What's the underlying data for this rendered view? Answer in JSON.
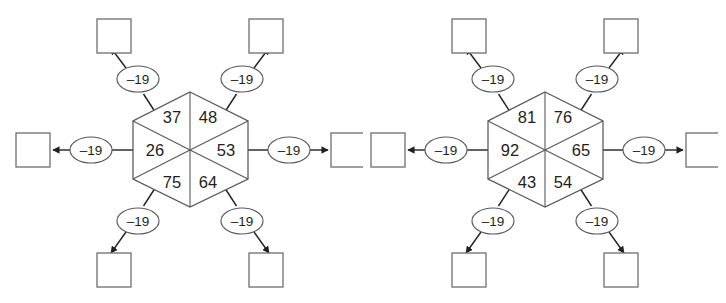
{
  "worksheet": {
    "title": "Hexagon subtraction puzzles",
    "background_color": "#ffffff",
    "line_color": "#58595b",
    "text_color": "#231f20",
    "box_stroke_color": "#6d6e71"
  },
  "figures": [
    {
      "id": "figure-left",
      "name": "hexagon-puzzle-1",
      "center": {
        "x": 190,
        "y": 150
      },
      "hexagon": {
        "radius": 58,
        "sectors": [
          {
            "position": "top-left",
            "value": "37"
          },
          {
            "position": "top-right",
            "value": "48"
          },
          {
            "position": "right",
            "value": "53"
          },
          {
            "position": "bottom-right",
            "value": "64"
          },
          {
            "position": "bottom-left",
            "value": "75"
          },
          {
            "position": "left",
            "value": "26"
          }
        ]
      },
      "operations": [
        {
          "position": "top-left",
          "label": "–19"
        },
        {
          "position": "top-right",
          "label": "–19"
        },
        {
          "position": "right",
          "label": "–19"
        },
        {
          "position": "bottom-right",
          "label": "–19"
        },
        {
          "position": "bottom-left",
          "label": "–19"
        },
        {
          "position": "left",
          "label": "–19"
        }
      ],
      "answer_boxes": [
        {
          "position": "top-left",
          "value": ""
        },
        {
          "position": "top-right",
          "value": ""
        },
        {
          "position": "right",
          "value": ""
        },
        {
          "position": "bottom-right",
          "value": ""
        },
        {
          "position": "bottom-left",
          "value": ""
        },
        {
          "position": "left",
          "value": ""
        }
      ]
    },
    {
      "id": "figure-right",
      "name": "hexagon-puzzle-2",
      "center": {
        "x": 190,
        "y": 150
      },
      "hexagon": {
        "radius": 58,
        "sectors": [
          {
            "position": "top-left",
            "value": "81"
          },
          {
            "position": "top-right",
            "value": "76"
          },
          {
            "position": "right",
            "value": "65"
          },
          {
            "position": "bottom-right",
            "value": "54"
          },
          {
            "position": "bottom-left",
            "value": "43"
          },
          {
            "position": "left",
            "value": "92"
          }
        ]
      },
      "operations": [
        {
          "position": "top-left",
          "label": "–19"
        },
        {
          "position": "top-right",
          "label": "–19"
        },
        {
          "position": "right",
          "label": "–19"
        },
        {
          "position": "bottom-right",
          "label": "–19"
        },
        {
          "position": "bottom-left",
          "label": "–19"
        },
        {
          "position": "left",
          "label": "–19"
        }
      ],
      "answer_boxes": [
        {
          "position": "top-left",
          "value": ""
        },
        {
          "position": "top-right",
          "value": ""
        },
        {
          "position": "right",
          "value": ""
        },
        {
          "position": "bottom-right",
          "value": ""
        },
        {
          "position": "bottom-left",
          "value": ""
        },
        {
          "position": "left",
          "value": ""
        }
      ]
    }
  ]
}
